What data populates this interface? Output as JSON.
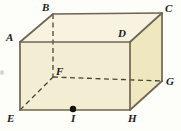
{
  "figure": {
    "name": "rectangular-prism",
    "background_color": "#fdfdfa",
    "colors": {
      "front_face": "#f3eed3",
      "top_face": "#f7f3e0",
      "right_face": "#efe7bd",
      "edge_stroke": "#6e6550",
      "hidden_edge_stroke": "#4a4436",
      "label_color": "#1b1b1b",
      "point_fill": "#111111"
    },
    "vertices": [
      {
        "id": "A",
        "label": "A",
        "x": 20,
        "y": 42,
        "label_x": 6,
        "label_y": 32,
        "hidden": false
      },
      {
        "id": "B",
        "label": "B",
        "x": 53,
        "y": 14,
        "label_x": 42,
        "label_y": 2,
        "hidden": false
      },
      {
        "id": "C",
        "label": "C",
        "x": 162,
        "y": 13,
        "label_x": 165,
        "label_y": 3,
        "hidden": false
      },
      {
        "id": "D",
        "label": "D",
        "x": 130,
        "y": 42,
        "label_x": 118,
        "label_y": 28,
        "hidden": false
      },
      {
        "id": "E",
        "label": "E",
        "x": 20,
        "y": 110,
        "label_x": 7,
        "label_y": 113,
        "hidden": false
      },
      {
        "id": "F",
        "label": "F",
        "x": 53,
        "y": 77,
        "label_x": 56,
        "label_y": 66,
        "hidden": true
      },
      {
        "id": "G",
        "label": "G",
        "x": 162,
        "y": 81,
        "label_x": 166,
        "label_y": 76,
        "hidden": false
      },
      {
        "id": "H",
        "label": "H",
        "x": 130,
        "y": 110,
        "label_x": 128,
        "label_y": 113,
        "hidden": false
      },
      {
        "id": "I",
        "label": "I",
        "x": 73,
        "y": 109,
        "label_x": 71,
        "label_y": 113,
        "hidden": false,
        "is_point": true
      }
    ],
    "faces": [
      {
        "id": "top-face",
        "name": "face-ABCD",
        "points": "20,42 53,14 162,13 130,42",
        "fill": "#f7f3e0"
      },
      {
        "id": "front-face",
        "name": "face-ADHE",
        "points": "20,42 130,42 130,110 20,110",
        "fill": "#f3eed3"
      },
      {
        "id": "right-face",
        "name": "face-DCGH",
        "points": "130,42 162,13 162,81 130,110",
        "fill": "#efe7bd"
      }
    ],
    "visible_edges": [
      {
        "id": "edge-AB",
        "x1": 20,
        "y1": 42,
        "x2": 53,
        "y2": 14
      },
      {
        "id": "edge-BC",
        "x1": 53,
        "y1": 14,
        "x2": 162,
        "y2": 13
      },
      {
        "id": "edge-CD",
        "x1": 162,
        "y1": 13,
        "x2": 130,
        "y2": 42
      },
      {
        "id": "edge-AD",
        "x1": 20,
        "y1": 42,
        "x2": 130,
        "y2": 42
      },
      {
        "id": "edge-AE",
        "x1": 20,
        "y1": 42,
        "x2": 20,
        "y2": 110
      },
      {
        "id": "edge-DH",
        "x1": 130,
        "y1": 42,
        "x2": 130,
        "y2": 110
      },
      {
        "id": "edge-CG",
        "x1": 162,
        "y1": 13,
        "x2": 162,
        "y2": 81
      },
      {
        "id": "edge-EH",
        "x1": 20,
        "y1": 110,
        "x2": 130,
        "y2": 110
      },
      {
        "id": "edge-HG",
        "x1": 130,
        "y1": 110,
        "x2": 162,
        "y2": 81
      }
    ],
    "hidden_edges": [
      {
        "id": "edge-BF",
        "x1": 53,
        "y1": 14,
        "x2": 53,
        "y2": 77
      },
      {
        "id": "edge-FG",
        "x1": 53,
        "y1": 77,
        "x2": 162,
        "y2": 81
      },
      {
        "id": "edge-EF",
        "x1": 20,
        "y1": 110,
        "x2": 53,
        "y2": 77
      }
    ],
    "marked_points": [
      {
        "id": "point-I",
        "x": 73,
        "y": 109,
        "radius": 3.2
      }
    ]
  }
}
